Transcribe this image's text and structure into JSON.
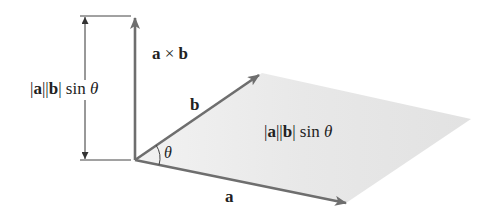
{
  "diagram": {
    "colors": {
      "vector": "#6e6e6e",
      "dimension_line": "#444444",
      "parallelogram_fill": "#e6e6e6",
      "text": "#222222",
      "background": "#ffffff"
    },
    "labels": {
      "cross_product": {
        "a": "a",
        "op": " × ",
        "b": "b"
      },
      "height": {
        "bar1": "|",
        "a": "a",
        "bar2": "||",
        "b": "b",
        "bar3": "|",
        "sin": " sin ",
        "theta": "θ"
      },
      "area": {
        "bar1": "|",
        "a": "a",
        "bar2": "||",
        "b": "b",
        "bar3": "|",
        "sin": " sin ",
        "theta": "θ"
      },
      "vector_a": "a",
      "vector_b": "b",
      "angle": "θ"
    },
    "geometry": {
      "origin": [
        135,
        160
      ],
      "a_tip": [
        346,
        203
      ],
      "b_tip": [
        259,
        75
      ],
      "far_corner": [
        471,
        119
      ],
      "axb_tip": [
        135,
        17
      ],
      "dimension_x": 85,
      "dimension_top": 16,
      "dimension_bottom": 160
    }
  }
}
